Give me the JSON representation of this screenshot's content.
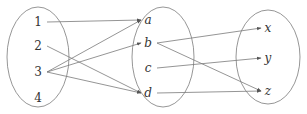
{
  "diagram": {
    "type": "mapping-diagram",
    "sets": [
      {
        "id": "A",
        "elements": [
          "1",
          "2",
          "3",
          "4"
        ],
        "italic": false
      },
      {
        "id": "B",
        "elements": [
          "a",
          "b",
          "c",
          "d"
        ],
        "italic": true
      },
      {
        "id": "C",
        "elements": [
          "x",
          "y",
          "z"
        ],
        "italic": true
      }
    ],
    "mappings": [
      {
        "from": "1",
        "to": "a"
      },
      {
        "from": "2",
        "to": "d"
      },
      {
        "from": "3",
        "to": "a"
      },
      {
        "from": "3",
        "to": "b"
      },
      {
        "from": "3",
        "to": "d"
      },
      {
        "from": "b",
        "to": "x"
      },
      {
        "from": "b",
        "to": "z"
      },
      {
        "from": "c",
        "to": "y"
      },
      {
        "from": "d",
        "to": "z"
      }
    ],
    "colors": {
      "stroke": "#7a7a7a",
      "text": "#333333"
    }
  }
}
